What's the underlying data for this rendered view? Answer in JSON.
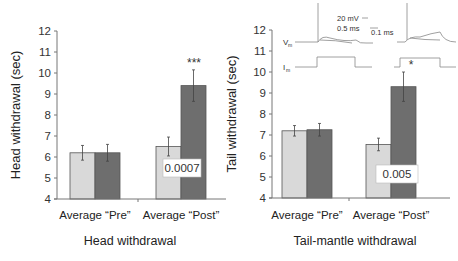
{
  "chart_data": [
    {
      "type": "bar",
      "title": "",
      "xlabel": "Head withdrawal",
      "ylabel": "Head withdrawal (sec)",
      "ylim": [
        4,
        12
      ],
      "yticks": [
        4,
        5,
        6,
        7,
        8,
        9,
        10,
        11,
        12
      ],
      "categories": [
        "Average “Pre”",
        "Average “Post”"
      ],
      "series": [
        {
          "name": "control",
          "color": "#d9d9d9",
          "values": [
            6.2,
            6.5
          ],
          "errors": [
            0.35,
            0.45
          ]
        },
        {
          "name": "treated",
          "color": "#6e6e6e",
          "values": [
            6.2,
            9.4
          ],
          "errors": [
            0.4,
            0.75
          ]
        }
      ],
      "annotations": {
        "significance": "***",
        "p_value": "0.0007"
      }
    },
    {
      "type": "bar",
      "title": "",
      "xlabel": "Tail-mantle withdrawal",
      "ylabel": "Tail withdrawal (sec)",
      "ylim": [
        4,
        12
      ],
      "yticks": [
        4,
        5,
        6,
        7,
        8,
        9,
        10,
        11,
        12
      ],
      "categories": [
        "Average “Pre”",
        "Average “Post”"
      ],
      "series": [
        {
          "name": "control",
          "color": "#d9d9d9",
          "values": [
            7.2,
            6.55
          ],
          "errors": [
            0.25,
            0.3
          ]
        },
        {
          "name": "treated",
          "color": "#6e6e6e",
          "values": [
            7.25,
            9.3
          ],
          "errors": [
            0.3,
            0.7
          ]
        }
      ],
      "annotations": {
        "significance": "*",
        "p_value": "0.005"
      },
      "inset": {
        "labels": {
          "vm": "V",
          "vm_sub": "m",
          "im": "I",
          "im_sub": "m",
          "scale_mv": "20 mV",
          "scale_ms1": "0.5 ms",
          "scale_ms2": "0.1 ms"
        }
      }
    }
  ]
}
